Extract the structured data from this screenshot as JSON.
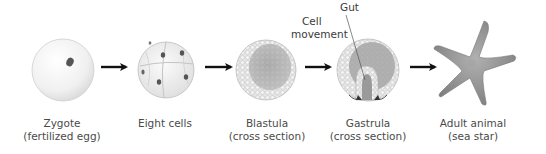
{
  "diagram": {
    "type": "process-flow",
    "stages": [
      {
        "id": "zygote",
        "name": "Zygote",
        "subtitle": "(fertilized egg)"
      },
      {
        "id": "eight-cells",
        "name": "Eight cells",
        "subtitle": ""
      },
      {
        "id": "blastula",
        "name": "Blastula",
        "subtitle": "(cross section)"
      },
      {
        "id": "gastrula",
        "name": "Gastrula",
        "subtitle": "(cross section)"
      },
      {
        "id": "adult",
        "name": "Adult animal",
        "subtitle": "(sea star)"
      }
    ],
    "callouts": {
      "gut": "Gut",
      "cell_movement_line1": "Cell",
      "cell_movement_line2": "movement"
    },
    "arrows": [
      {
        "from": "zygote",
        "to": "eight-cells"
      },
      {
        "from": "eight-cells",
        "to": "blastula"
      },
      {
        "from": "blastula",
        "to": "gastrula"
      },
      {
        "from": "gastrula",
        "to": "adult"
      }
    ],
    "colors": {
      "arrow": "#111111",
      "label_text": "#4a4a4a",
      "cell_fill": "#efefef",
      "cell_outline": "#b8b8b8",
      "nucleus": "#555555",
      "starfish": "#8e8e8e"
    }
  }
}
